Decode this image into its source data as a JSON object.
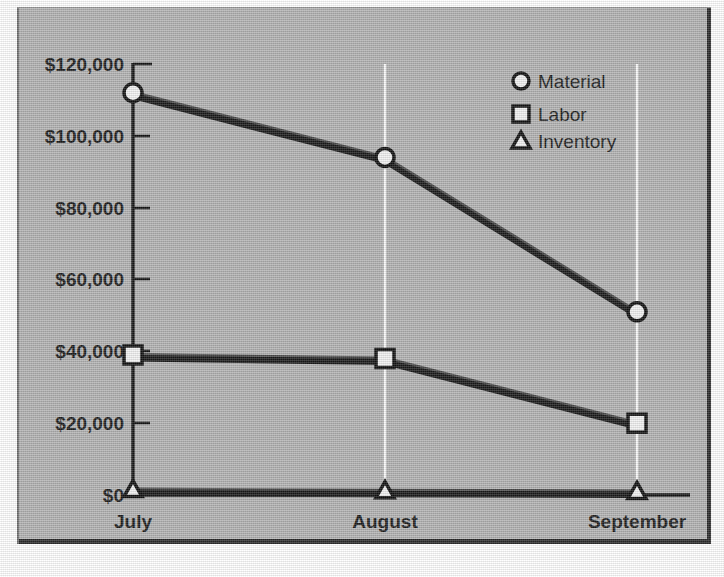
{
  "chart_data": {
    "type": "line",
    "title": "",
    "subtitle": "",
    "xlabel": "",
    "ylabel": "",
    "categories": [
      "July",
      "August",
      "September"
    ],
    "series": [
      {
        "name": "Material",
        "marker": "circle",
        "values": [
          112000,
          94000,
          51000
        ]
      },
      {
        "name": "Labor",
        "marker": "square",
        "values": [
          39000,
          38000,
          20000
        ]
      },
      {
        "name": "Inventory",
        "marker": "triangle",
        "values": [
          1500,
          1200,
          1000
        ]
      }
    ],
    "ylim": [
      0,
      120000
    ],
    "ytick_values": [
      0,
      20000,
      40000,
      60000,
      80000,
      100000,
      120000
    ],
    "ytick_labels": [
      "$0",
      "$20,000",
      "$40,000",
      "$60,000",
      "$80,000",
      "$100,000",
      "$120,000"
    ],
    "grid": "vertical-only",
    "legend_position": "top-right",
    "value_prefix": "$"
  },
  "axes": {
    "y_ticks": [
      {
        "label": "$120,000",
        "value": 120000
      },
      {
        "label": "$100,000",
        "value": 100000
      },
      {
        "label": "$80,000",
        "value": 80000
      },
      {
        "label": "$60,000",
        "value": 60000
      },
      {
        "label": "$40,000",
        "value": 40000
      },
      {
        "label": "$20,000",
        "value": 20000
      },
      {
        "label": "$0",
        "value": 0
      }
    ],
    "x_categories": [
      {
        "label": "July"
      },
      {
        "label": "August"
      },
      {
        "label": "September"
      }
    ]
  },
  "legend": {
    "items": [
      {
        "label": "Material",
        "icon": "circle-marker-icon"
      },
      {
        "label": "Labor",
        "icon": "square-marker-icon"
      },
      {
        "label": "Inventory",
        "icon": "triangle-marker-icon"
      }
    ]
  },
  "colors": {
    "canvas": "#b3b3b3",
    "line": "#1a1a1a",
    "marker_fill": "#f2f2f2",
    "marker_stroke": "#111111",
    "gridline": "#fbfbfb",
    "axis": "#141414",
    "text": "#1c1c1c",
    "frame": "#2a2a2a"
  }
}
